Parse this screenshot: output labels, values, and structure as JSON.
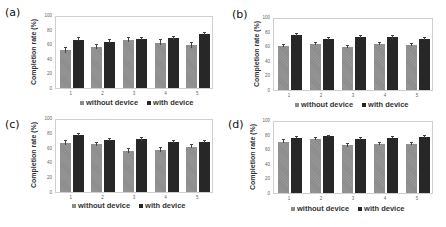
{
  "chart_data": [
    {
      "panel": "(a)",
      "type": "bar",
      "categories": [
        "1",
        "2",
        "3",
        "4",
        "5"
      ],
      "series": [
        {
          "name": "without device",
          "color": "#8c8c8c",
          "values": [
            53,
            58,
            68,
            64,
            60
          ],
          "errors": [
            3,
            3,
            3,
            3,
            3
          ]
        },
        {
          "name": "with device",
          "color": "#272727",
          "values": [
            68,
            65,
            69,
            70,
            76
          ],
          "errors": [
            2,
            2,
            2,
            2,
            2
          ]
        }
      ],
      "title": "",
      "xlabel": "",
      "ylabel": "Completion rate (%)",
      "ylim": [
        0,
        100
      ],
      "yticks": [
        "0",
        "20",
        "40",
        "60",
        "80",
        "100"
      ],
      "grid": false,
      "legend_position": "bottom"
    },
    {
      "panel": "(b)",
      "type": "bar",
      "categories": [
        "1",
        "2",
        "3",
        "4",
        "5"
      ],
      "series": [
        {
          "name": "without device",
          "color": "#8c8c8c",
          "values": [
            62,
            65,
            60,
            65,
            64
          ],
          "errors": [
            1.5,
            1.5,
            1.5,
            1.5,
            1.5
          ]
        },
        {
          "name": "with device",
          "color": "#272727",
          "values": [
            78,
            72,
            75,
            74,
            72
          ],
          "errors": [
            1.5,
            1.5,
            1.5,
            1.5,
            1.5
          ]
        }
      ],
      "title": "",
      "xlabel": "",
      "ylabel": "Completion rate (%)",
      "ylim": [
        0,
        100
      ],
      "yticks": [
        "0",
        "20",
        "40",
        "60",
        "80",
        "100"
      ],
      "grid": false,
      "legend_position": "bottom"
    },
    {
      "panel": "(c)",
      "type": "bar",
      "categories": [
        "1",
        "2",
        "3",
        "4",
        "5"
      ],
      "series": [
        {
          "name": "without device",
          "color": "#8c8c8c",
          "values": [
            68,
            66,
            57,
            58,
            63
          ],
          "errors": [
            2.5,
            2.5,
            2.5,
            2.5,
            2.5
          ]
        },
        {
          "name": "with device",
          "color": "#272727",
          "values": [
            79,
            72,
            73,
            70,
            69
          ],
          "errors": [
            1.5,
            1.5,
            1.5,
            1.5,
            1.5
          ]
        }
      ],
      "title": "",
      "xlabel": "",
      "ylabel": "Completion rate (%)",
      "ylim": [
        0,
        100
      ],
      "yticks": [
        "0",
        "20",
        "40",
        "60",
        "80",
        "100"
      ],
      "grid": false,
      "legend_position": "bottom"
    },
    {
      "panel": "(d)",
      "type": "bar",
      "categories": [
        "1",
        "2",
        "3",
        "4",
        "5"
      ],
      "series": [
        {
          "name": "without device",
          "color": "#8c8c8c",
          "values": [
            72,
            76,
            67,
            69,
            69
          ],
          "errors": [
            2,
            2,
            2,
            2,
            2
          ]
        },
        {
          "name": "with device",
          "color": "#272727",
          "values": [
            78,
            80,
            76,
            78,
            79
          ],
          "errors": [
            1,
            1,
            1,
            1,
            1
          ]
        }
      ],
      "title": "",
      "xlabel": "",
      "ylabel": "Completion rate (%)",
      "ylim": [
        0,
        100
      ],
      "yticks": [
        "0",
        "20",
        "40",
        "60",
        "80",
        "100"
      ],
      "grid": false,
      "legend_position": "bottom"
    }
  ],
  "panels": [
    {
      "label": "(a)"
    },
    {
      "label": "(b)"
    },
    {
      "label": "(c)"
    },
    {
      "label": "(d)"
    }
  ],
  "ylabel": "Completion rate (%)",
  "legend": {
    "without": "without device",
    "with": "with device"
  }
}
